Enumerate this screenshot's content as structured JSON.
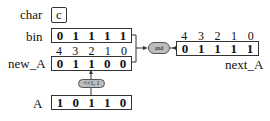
{
  "char": {
    "label": "char",
    "value": "c"
  },
  "bin": {
    "label": "bin",
    "bits": [
      "0",
      "1",
      "1",
      "1",
      "1"
    ]
  },
  "new_A": {
    "label": "new_A",
    "indices": [
      "4",
      "3",
      "2",
      "1",
      "0"
    ],
    "bits": [
      "0",
      "1",
      "1",
      "0",
      "0"
    ]
  },
  "A": {
    "label": "A",
    "bits": [
      "1",
      "0",
      "1",
      "1",
      "0"
    ]
  },
  "next_A": {
    "label": "next_A",
    "indices": [
      "4",
      "3",
      "2",
      "1",
      "0"
    ],
    "bits": [
      "0",
      "1",
      "1",
      "1",
      "1"
    ]
  },
  "ops": {
    "shift": "<<1, 1",
    "and": "and"
  }
}
